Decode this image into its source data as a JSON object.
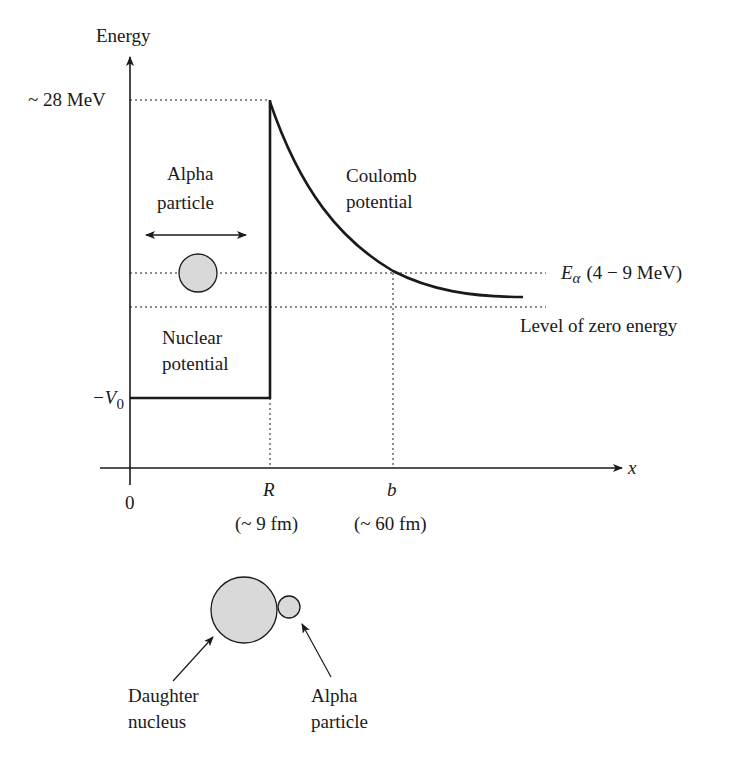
{
  "diagram": {
    "y_axis_label": "Energy",
    "x_axis_label": "x",
    "origin_label": "0",
    "barrier_height_label": "~ 28 MeV",
    "well_depth_label": "−V",
    "well_depth_subscript": "0",
    "alpha_energy_symbol": "E",
    "alpha_energy_subscript": "α",
    "alpha_energy_range": "(4 − 9 MeV)",
    "zero_energy_label": "Level of zero energy",
    "coulomb_label_line1": "Coulomb",
    "coulomb_label_line2": "potential",
    "nuclear_label_line1": "Nuclear",
    "nuclear_label_line2": "potential",
    "alpha_top_label_line1": "Alpha",
    "alpha_top_label_line2": "particle",
    "r_tick_label": "R",
    "r_value_label": "(~ 9 fm)",
    "b_tick_label": "b",
    "b_value_label": "(~ 60 fm)",
    "daughter_label_line1": "Daughter",
    "daughter_label_line2": "nucleus",
    "alpha_bottom_label_line1": "Alpha",
    "alpha_bottom_label_line2": "particle",
    "colors": {
      "line": "#1a1a1a",
      "particle_fill": "#d9d9d9"
    }
  }
}
